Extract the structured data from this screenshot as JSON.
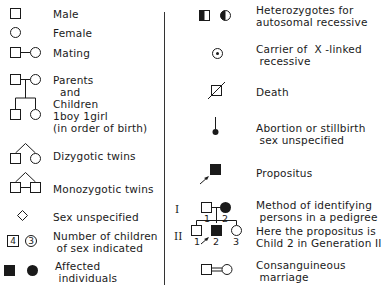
{
  "left_column": [
    {
      "symbol": "male-square",
      "label": "Male"
    },
    {
      "symbol": "female-circle",
      "label": "Female"
    },
    {
      "symbol": "mating-line",
      "label": "Mating"
    },
    {
      "symbol": "parents-children",
      "label_lines": [
        "Parents",
        "  and",
        "Children",
        "1boy 1girl",
        "(in order of birth)"
      ]
    },
    {
      "symbol": "dizygotic-twins",
      "label": "Dizygotic twins"
    },
    {
      "symbol": "monozygotic-twins",
      "label": "Monozygotic twins"
    },
    {
      "symbol": "diamond",
      "label": "Sex unspecified"
    },
    {
      "symbol": "numbered-shapes",
      "numbers": [
        "4",
        "3"
      ],
      "label_lines": [
        "Number of children",
        " of sex indicated"
      ]
    },
    {
      "symbol": "filled-shapes",
      "label_lines": [
        "Affected",
        " individuals"
      ]
    }
  ],
  "right_column": [
    {
      "symbol": "half-filled-shapes",
      "label_lines": [
        "Heterozygotes for",
        "autosomal recessive"
      ]
    },
    {
      "symbol": "dotted-circle",
      "label_lines": [
        "Carrier of  X -linked",
        " recessive"
      ]
    },
    {
      "symbol": "slashed-square",
      "label": "Death"
    },
    {
      "symbol": "stalk-dot",
      "label_lines": [
        "Abortion or stillbirth",
        " sex unspecified"
      ]
    },
    {
      "symbol": "arrow-filled-square",
      "label": "Propositus"
    },
    {
      "symbol": "pedigree-example",
      "generations": [
        "I",
        "II"
      ],
      "gen1_numbers": [
        "1",
        "2"
      ],
      "gen2_numbers": [
        "1",
        "2",
        "3"
      ],
      "label_lines": [
        "Method of identifying",
        " persons in a pedigree",
        "Here the propositus is",
        "Child 2 in Generation II"
      ]
    },
    {
      "symbol": "consanguineous-double-line",
      "label_lines": [
        "Consanguineous",
        " marriage"
      ]
    }
  ],
  "colors": {
    "ink": "#1a1a1a",
    "background": "#ffffff"
  }
}
